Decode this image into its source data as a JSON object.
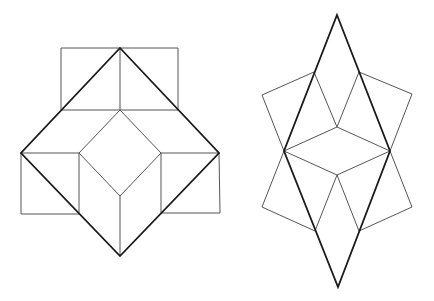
{
  "figures": [
    {
      "id": "left-figure",
      "description": "Large square (rotated 45°) with inner diamond, three attached squares",
      "thick_outline": [
        [
          120,
          48
        ],
        [
          219,
          153
        ],
        [
          120,
          256
        ],
        [
          21,
          153
        ]
      ],
      "thin_segments": [
        [
          [
            61,
            48
          ],
          [
            178,
            48
          ]
        ],
        [
          [
            61,
            48
          ],
          [
            61,
            110
          ]
        ],
        [
          [
            178,
            48
          ],
          [
            178,
            110
          ]
        ],
        [
          [
            61,
            110
          ],
          [
            178,
            110
          ]
        ],
        [
          [
            120,
            48
          ],
          [
            120,
            110
          ]
        ],
        [
          [
            120,
            110
          ],
          [
            79,
            153
          ]
        ],
        [
          [
            120,
            110
          ],
          [
            161,
            153
          ]
        ],
        [
          [
            79,
            153
          ],
          [
            120,
            196
          ]
        ],
        [
          [
            161,
            153
          ],
          [
            120,
            196
          ]
        ],
        [
          [
            120,
            196
          ],
          [
            120,
            256
          ]
        ],
        [
          [
            21,
            153
          ],
          [
            79,
            153
          ]
        ],
        [
          [
            161,
            153
          ],
          [
            219,
            153
          ]
        ],
        [
          [
            79,
            153
          ],
          [
            79,
            214
          ]
        ],
        [
          [
            161,
            153
          ],
          [
            161,
            213
          ]
        ],
        [
          [
            21,
            153
          ],
          [
            21,
            214
          ]
        ],
        [
          [
            21,
            214
          ],
          [
            79,
            214
          ]
        ],
        [
          [
            219,
            153
          ],
          [
            220,
            213
          ]
        ],
        [
          [
            161,
            213
          ],
          [
            220,
            213
          ]
        ]
      ]
    },
    {
      "id": "right-figure",
      "description": "Tall rhombus with inner rhombus and four attached squares",
      "thick_outline": [
        [
          337,
          15
        ],
        [
          390,
          151
        ],
        [
          338,
          287
        ],
        [
          284,
          151
        ]
      ],
      "thin_segments": [
        [
          [
            314,
            72
          ],
          [
            262,
            95
          ]
        ],
        [
          [
            262,
            95
          ],
          [
            284,
            151
          ]
        ],
        [
          [
            359,
            72
          ],
          [
            412,
            94
          ]
        ],
        [
          [
            412,
            94
          ],
          [
            390,
            151
          ]
        ],
        [
          [
            314,
            72
          ],
          [
            337,
            127
          ]
        ],
        [
          [
            359,
            72
          ],
          [
            337,
            127
          ]
        ],
        [
          [
            337,
            127
          ],
          [
            284,
            151
          ]
        ],
        [
          [
            337,
            127
          ],
          [
            390,
            151
          ]
        ],
        [
          [
            284,
            151
          ],
          [
            337,
            175
          ]
        ],
        [
          [
            390,
            151
          ],
          [
            337,
            175
          ]
        ],
        [
          [
            337,
            175
          ],
          [
            315,
            231
          ]
        ],
        [
          [
            337,
            175
          ],
          [
            359,
            231
          ]
        ],
        [
          [
            284,
            151
          ],
          [
            262,
            207
          ]
        ],
        [
          [
            262,
            207
          ],
          [
            315,
            231
          ]
        ],
        [
          [
            390,
            151
          ],
          [
            412,
            207
          ]
        ],
        [
          [
            412,
            207
          ],
          [
            359,
            231
          ]
        ]
      ]
    }
  ],
  "colors": {
    "background": "#ffffff",
    "thin_line": "#555555",
    "thick_line": "#1a1a1a"
  }
}
